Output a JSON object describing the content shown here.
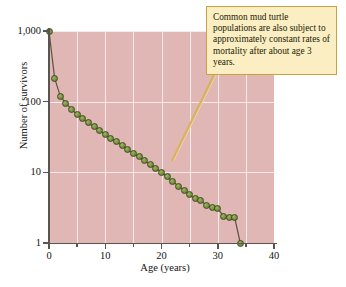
{
  "figure": {
    "background_color": "#ffffff",
    "plot_background_color": "#e0b7b5",
    "grid_color": "#f6eaea",
    "marker_color": "#7d9943",
    "line_color": "#5e5240",
    "callout_fill": "#faeec2",
    "callout_border": "#c8a23c",
    "leader_color": "#d8b25e"
  },
  "callout": {
    "text": "Common mud turtle populations are also subject to approximately constant rates of mortality after about age 3 years."
  },
  "chart_data": {
    "type": "line",
    "title": "",
    "xlabel": "Age (years)",
    "ylabel": "Number of survivors",
    "xlim": [
      0,
      40
    ],
    "ylim": [
      1,
      1000
    ],
    "yscale": "log",
    "grid": true,
    "legend": null,
    "xticks": [
      0,
      10,
      20,
      30,
      40
    ],
    "xtick_labels": [
      "0",
      "10",
      "20",
      "30",
      "40"
    ],
    "xticks_minor": [
      5,
      15,
      25,
      35
    ],
    "yticks": [
      1,
      10,
      100,
      1000
    ],
    "ytick_labels": [
      "1",
      "10",
      "100",
      "1,000"
    ],
    "series": [
      {
        "name": "Common mud turtle survivorship",
        "x": [
          0,
          1,
          2,
          3,
          4,
          5,
          6,
          7,
          8,
          9,
          10,
          11,
          12,
          13,
          14,
          15,
          16,
          17,
          18,
          19,
          20,
          21,
          22,
          23,
          24,
          25,
          26,
          27,
          28,
          29,
          30,
          31,
          32,
          33,
          34
        ],
        "y": [
          1000,
          215,
          120,
          95,
          78,
          66,
          58,
          50,
          44,
          39,
          34,
          30,
          27,
          24,
          21,
          18.5,
          16.5,
          14.5,
          13,
          11.5,
          10,
          8.6,
          7.4,
          6.4,
          5.6,
          4.8,
          4.2,
          4.0,
          3.4,
          3.2,
          3.1,
          2.4,
          2.3,
          2.3,
          1
        ]
      }
    ]
  }
}
